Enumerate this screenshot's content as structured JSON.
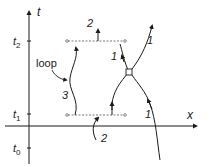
{
  "axes": {
    "vertical_label": "t",
    "horizontal_label": "x",
    "ticks": [
      {
        "base": "t",
        "sub": "2"
      },
      {
        "base": "t",
        "sub": "1"
      },
      {
        "base": "t",
        "sub": "0"
      }
    ]
  },
  "annotations": {
    "loop_label": "loop",
    "upper_arrow_label": "2",
    "lower_arrow_label": "2",
    "loop_curve_label": "3",
    "left_branch_label": "1",
    "upper_right_label": "1",
    "lower_right_label": "1"
  },
  "colors": {
    "line": "#1a1a1a",
    "dashed": "#555555"
  }
}
